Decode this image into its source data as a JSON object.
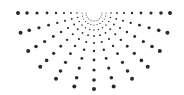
{
  "graphic": {
    "name": "half-sunburst-dot-pattern",
    "color": "#2a2a2a",
    "center": [
      94,
      13
    ],
    "rays": 13,
    "angle_start_deg": 0,
    "angle_end_deg": 180,
    "radii": [
      8,
      12,
      17,
      23,
      30,
      38,
      47,
      57,
      67,
      76
    ],
    "dot_sizes": [
      0.5,
      0.6,
      0.75,
      0.9,
      1.05,
      1.2,
      1.4,
      1.6,
      1.8,
      2.0
    ]
  }
}
